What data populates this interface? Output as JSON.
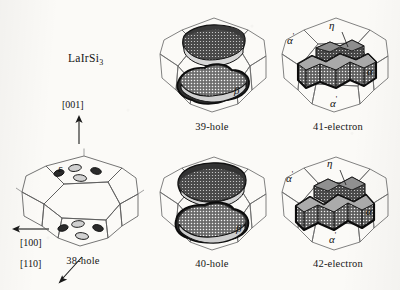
{
  "figure": {
    "compound": "LaIrSi",
    "compound_subscript": "3",
    "background_color": "#fbfaf7",
    "ink_color": "#1a1a1a"
  },
  "directions": [
    {
      "label": "[001]",
      "arrow": "up"
    },
    {
      "label": "[100]",
      "arrow": "left"
    },
    {
      "label": "[110]",
      "arrow": "down-left"
    }
  ],
  "panels": [
    {
      "id": "38-hole",
      "caption": "38-hole",
      "type": "brillouin-zone-small-pockets",
      "sheet_labels": [
        {
          "text": "ε",
          "sup": ""
        }
      ],
      "pocket_count": 6
    },
    {
      "id": "39-hole",
      "caption": "39-hole",
      "type": "brillouin-zone-stacked-sheets",
      "sheet_labels": [
        {
          "text": "β",
          "sup": ""
        }
      ],
      "sheet_count": 2
    },
    {
      "id": "41-electron",
      "caption": "41-electron",
      "type": "brillouin-zone-cross-sheet",
      "sheet_labels": [
        {
          "text": "α",
          "sup": "'"
        },
        {
          "text": "η",
          "sup": ""
        },
        {
          "text": "α",
          "sup": ""
        },
        {
          "text": "α",
          "sup": "'"
        }
      ],
      "sheet_count": 2
    },
    {
      "id": "40-hole",
      "caption": "40-hole",
      "type": "brillouin-zone-stacked-sheets",
      "sheet_labels": [
        {
          "text": "β",
          "sup": ""
        }
      ],
      "sheet_count": 2
    },
    {
      "id": "42-electron",
      "caption": "42-electron",
      "type": "brillouin-zone-cross-sheet",
      "sheet_labels": [
        {
          "text": "α",
          "sup": "'"
        },
        {
          "text": "η",
          "sup": ""
        },
        {
          "text": "α",
          "sup": ""
        },
        {
          "text": "α",
          "sup": "'"
        }
      ],
      "sheet_count": 2
    }
  ],
  "captions": {
    "p38": "38-hole",
    "p39": "39-hole",
    "p40": "40-hole",
    "p41": "41-electron",
    "p42": "42-electron"
  },
  "labels": {
    "dir001": "[001]",
    "dir100": "[100]",
    "dir110": "[110]",
    "epsilon": "ε",
    "beta": "β",
    "eta": "η",
    "alpha": "α",
    "alpha_prime": "α",
    "prime_mark": "'"
  }
}
